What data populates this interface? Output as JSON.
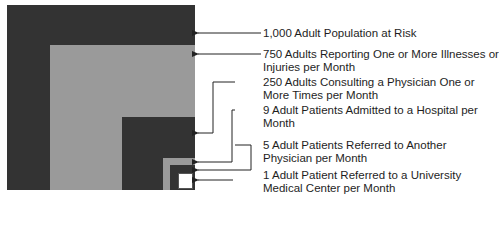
{
  "diagram": {
    "type": "nested-squares",
    "colors": {
      "dark": "#333333",
      "gray": "#9a9a9a",
      "white": "#ffffff",
      "line": "#222222"
    },
    "levels": [
      {
        "count": 1000,
        "text_line1": "1,000 Adult Population at Risk",
        "text_line2": ""
      },
      {
        "count": 750,
        "text_line1": "750 Adults Reporting One or More Illnesses or",
        "text_line2": "Injuries per Month"
      },
      {
        "count": 250,
        "text_line1": "250 Adults Consulting a Physician One or",
        "text_line2": "More Times per Month"
      },
      {
        "count": 9,
        "text_line1": "9 Adult Patients Admitted to a Hospital per",
        "text_line2": "Month"
      },
      {
        "count": 5,
        "text_line1": "5 Adult Patients Referred to Another",
        "text_line2": "Physician per Month"
      },
      {
        "count": 1,
        "text_line1": "1 Adult Patient Referred to a University",
        "text_line2": "Medical Center per Month"
      }
    ]
  }
}
